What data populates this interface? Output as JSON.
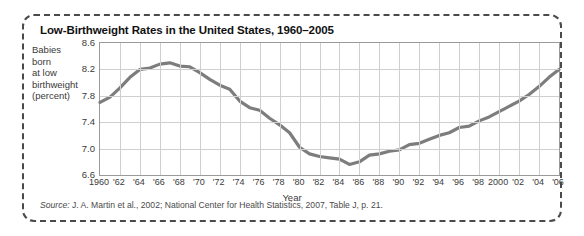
{
  "figure": {
    "title": "Low-Birthweight Rates in the United States, 1960–2005",
    "source_prefix": "Source:",
    "source_text": " J. A. Martin et al., 2002; National Center for Health Statistics, 2007, Table J, p. 21.",
    "border_color": "#4a4a4a"
  },
  "chart_data": {
    "type": "line",
    "title": "Low-Birthweight Rates in the United States, 1960–2005",
    "xlabel": "Year",
    "ylabel": "Babies born at low birthweight (percent)",
    "ylabel_lines": [
      "Babies",
      "born",
      "at low",
      "birthweight",
      "(percent)"
    ],
    "xlim": [
      1960,
      2006
    ],
    "ylim": [
      6.6,
      8.6
    ],
    "yticks": [
      6.6,
      7.0,
      7.4,
      7.8,
      8.2,
      8.6
    ],
    "ytick_labels": [
      "6.6",
      "7.0",
      "7.4",
      "7.8",
      "8.2",
      "8.6"
    ],
    "xticks": [
      1960,
      1962,
      1964,
      1966,
      1968,
      1970,
      1972,
      1974,
      1976,
      1978,
      1980,
      1982,
      1984,
      1986,
      1988,
      1990,
      1992,
      1994,
      1996,
      1998,
      2000,
      2002,
      2004,
      2006
    ],
    "xtick_labels": [
      "1960",
      "'62",
      "'64",
      "'66",
      "'68",
      "'70",
      "'72",
      "'74",
      "'76",
      "'78",
      "'80",
      "'82",
      "'84",
      "'86",
      "'88",
      "'90",
      "'92",
      "'94",
      "'96",
      "'98",
      "2000",
      "'02",
      "'04",
      "'06"
    ],
    "grid": true,
    "legend": null,
    "line_color": "#7d7d7d",
    "line_width": 3.2,
    "x": [
      1960,
      1961,
      1962,
      1963,
      1964,
      1965,
      1966,
      1967,
      1968,
      1969,
      1970,
      1971,
      1972,
      1973,
      1974,
      1975,
      1976,
      1977,
      1978,
      1979,
      1980,
      1981,
      1982,
      1983,
      1984,
      1985,
      1986,
      1987,
      1988,
      1989,
      1990,
      1991,
      1992,
      1993,
      1994,
      1995,
      1996,
      1997,
      1998,
      1999,
      2000,
      2001,
      2002,
      2003,
      2004,
      2005,
      2006
    ],
    "values": [
      7.7,
      7.78,
      7.92,
      8.08,
      8.2,
      8.22,
      8.28,
      8.3,
      8.25,
      8.24,
      8.15,
      8.05,
      7.96,
      7.9,
      7.72,
      7.62,
      7.58,
      7.46,
      7.36,
      7.24,
      7.02,
      6.92,
      6.88,
      6.86,
      6.84,
      6.76,
      6.8,
      6.9,
      6.92,
      6.96,
      6.98,
      7.06,
      7.08,
      7.14,
      7.2,
      7.24,
      7.32,
      7.34,
      7.42,
      7.48,
      7.56,
      7.64,
      7.72,
      7.82,
      7.94,
      8.08,
      8.2
    ]
  }
}
